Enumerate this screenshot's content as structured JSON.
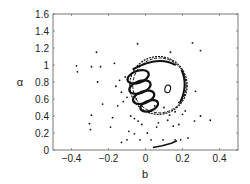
{
  "chart_data": {
    "type": "scatter",
    "title": "",
    "xlabel": "b",
    "ylabel": "α",
    "xlim": [
      -0.5,
      0.5
    ],
    "ylim": [
      0,
      1.6
    ],
    "xticks": [
      -0.4,
      -0.2,
      0,
      0.2,
      0.4
    ],
    "xtick_labels": [
      "-0.4",
      "-0.2",
      "0",
      "0.2",
      "0.4"
    ],
    "yticks": [
      0,
      0.2,
      0.4,
      0.6,
      0.8,
      1,
      1.2,
      1.4,
      1.6
    ],
    "ytick_labels": [
      "0",
      "0.2",
      "0.4",
      "0.6",
      "0.8",
      "1",
      "1.2",
      "1.4",
      "1.6"
    ],
    "grid": false,
    "legend": null,
    "series": [
      {
        "name": "scattered points",
        "style": "dots",
        "color": "#111111",
        "points": [
          [
            -0.373,
            0.99
          ],
          [
            -0.368,
            0.92
          ],
          [
            -0.292,
            0.98
          ],
          [
            -0.243,
            0.98
          ],
          [
            -0.265,
            1.15
          ],
          [
            -0.259,
            0.8
          ],
          [
            -0.232,
            0.54
          ],
          [
            -0.292,
            0.41
          ],
          [
            -0.303,
            0.31
          ],
          [
            -0.297,
            0.24
          ],
          [
            -0.178,
            0.38
          ],
          [
            -0.189,
            0.27
          ],
          [
            -0.168,
            1.02
          ],
          [
            -0.043,
            1.25
          ],
          [
            0.254,
            1.26
          ],
          [
            0.297,
            1.17
          ],
          [
            0.135,
            1.15
          ],
          [
            0.27,
            0.69
          ],
          [
            0.297,
            0.4
          ],
          [
            0.265,
            0.34
          ],
          [
            0.35,
            0.35
          ],
          [
            0.2,
            0.42
          ],
          [
            0.215,
            0.46
          ],
          [
            0.16,
            0.45
          ],
          [
            0.18,
            0.56
          ],
          [
            0.21,
            0.65
          ],
          [
            0.095,
            0.12
          ],
          [
            0.03,
            0.12
          ],
          [
            -0.03,
            0.12
          ],
          [
            -0.1,
            0.12
          ],
          [
            -0.13,
            0.09
          ],
          [
            0.16,
            0.12
          ],
          [
            0.19,
            0.12
          ],
          [
            0.23,
            0.14
          ],
          [
            -0.08,
            0.4
          ],
          [
            -0.06,
            0.37
          ],
          [
            -0.04,
            0.34
          ],
          [
            -0.02,
            0.3
          ],
          [
            0.02,
            0.44
          ],
          [
            -0.12,
            0.57
          ],
          [
            -0.15,
            0.52
          ],
          [
            -0.1,
            0.62
          ],
          [
            -0.05,
            0.6
          ],
          [
            0.05,
            0.52
          ],
          [
            0.1,
            0.5
          ],
          [
            -0.01,
            0.55
          ],
          [
            -0.02,
            0.47
          ],
          [
            0.13,
            0.41
          ],
          [
            0.12,
            0.35
          ],
          [
            0.07,
            0.32
          ],
          [
            0.06,
            0.27
          ],
          [
            -0.09,
            0.22
          ],
          [
            -0.06,
            0.19
          ],
          [
            0.01,
            0.2
          ],
          [
            0.15,
            0.28
          ],
          [
            0.18,
            0.3
          ],
          [
            -0.16,
            0.75
          ],
          [
            -0.14,
            0.82
          ],
          [
            -0.13,
            0.68
          ],
          [
            -0.11,
            0.86
          ]
        ]
      },
      {
        "name": "attractor outer ring",
        "style": "dense-curve",
        "color": "#111111",
        "center": [
          0.07,
          0.76
        ],
        "radius_b": 0.155,
        "radius_alpha": 0.34
      },
      {
        "name": "attractor inner loops",
        "style": "dense-curve",
        "color": "#111111",
        "loops": [
          {
            "center": [
              -0.04,
              0.86
            ],
            "rb": 0.06,
            "ra": 0.07
          },
          {
            "center": [
              -0.03,
              0.74
            ],
            "rb": 0.06,
            "ra": 0.07
          },
          {
            "center": [
              -0.01,
              0.62
            ],
            "rb": 0.06,
            "ra": 0.07
          },
          {
            "center": [
              0.02,
              0.52
            ],
            "rb": 0.05,
            "ra": 0.06
          }
        ]
      },
      {
        "name": "small inner ellipse",
        "style": "curve",
        "color": "#111111",
        "center": [
          0.12,
          0.72
        ],
        "radius_b": 0.015,
        "radius_alpha": 0.045
      },
      {
        "name": "bottom arc",
        "style": "curve",
        "color": "#111111",
        "points": [
          [
            0.04,
            0.03
          ],
          [
            0.09,
            0.05
          ],
          [
            0.14,
            0.08
          ],
          [
            0.17,
            0.11
          ]
        ]
      }
    ]
  },
  "axes": {
    "xlabel": "b",
    "ylabel": "α"
  }
}
